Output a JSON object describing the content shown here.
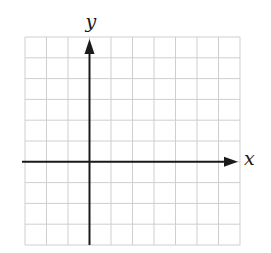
{
  "diagram": {
    "type": "coordinate-grid",
    "grid": {
      "columns": 10,
      "rows": 10,
      "line_color": "#cfcfcf",
      "left": 25,
      "top": 37,
      "right": 240,
      "bottom": 245
    },
    "axes": {
      "color": "#1a1a1a",
      "x_axis": {
        "label": "x",
        "row_from_top": 6,
        "arrow": "right"
      },
      "y_axis": {
        "label": "y",
        "column_from_left": 3,
        "arrow": "up"
      }
    }
  },
  "chart_data": {
    "type": "diagram",
    "title": "",
    "xlabel": "x",
    "ylabel": "y",
    "grid": true,
    "grid_columns": 10,
    "grid_rows": 10,
    "x_range_units": [
      -3,
      7
    ],
    "y_range_units": [
      -4,
      6
    ],
    "series": []
  }
}
